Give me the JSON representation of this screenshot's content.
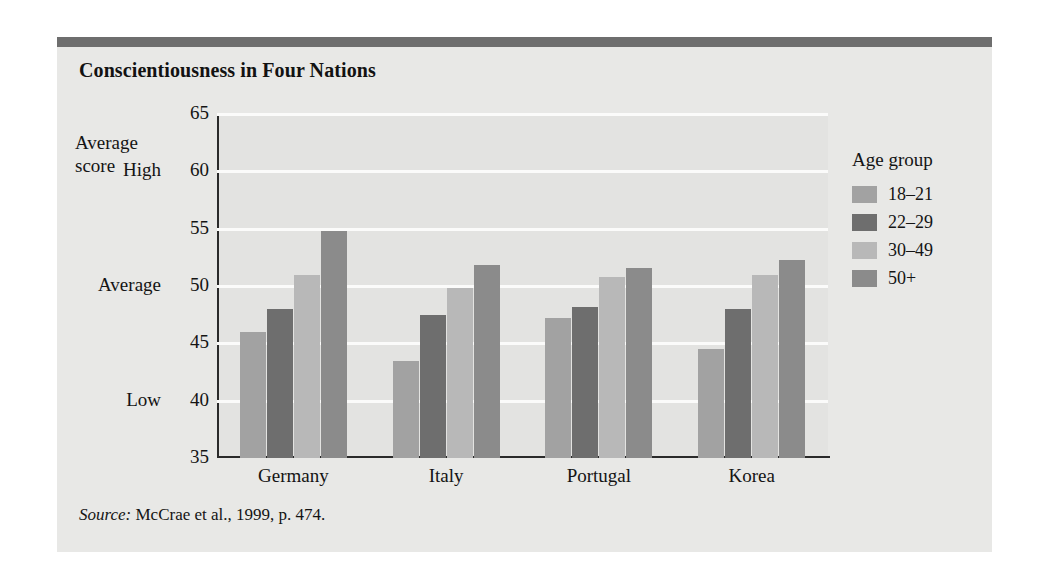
{
  "figure": {
    "title": "Conscientiousness in Four Nations",
    "source_label": "Source:",
    "source_text": "McCrae et al., 1999, p. 474."
  },
  "legend": {
    "title": "Age group"
  },
  "axis": {
    "y_caption_line1": "Average",
    "y_caption_line2": "score"
  },
  "chart_data": {
    "type": "bar",
    "title": "Conscientiousness in Four Nations",
    "xlabel": "",
    "ylabel": "Average score",
    "ylim": [
      35,
      65
    ],
    "yticks": [
      35,
      40,
      45,
      50,
      55,
      60,
      65
    ],
    "ytick_labels": [
      "35",
      "40",
      "45",
      "50",
      "55",
      "60",
      "65"
    ],
    "y_anchor_labels": [
      {
        "value": 65,
        "text": "Average score"
      },
      {
        "value": 60,
        "text": "High"
      },
      {
        "value": 50,
        "text": "Average"
      },
      {
        "value": 40,
        "text": "Low"
      }
    ],
    "grid": true,
    "grid_axis": "y",
    "legend_position": "right",
    "legend_title": "Age group",
    "categories": [
      "Germany",
      "Italy",
      "Portugal",
      "Korea"
    ],
    "series": [
      {
        "name": "18–21",
        "color": "#a2a2a2",
        "values": [
          46.0,
          43.5,
          47.2,
          44.5
        ]
      },
      {
        "name": "22–29",
        "color": "#6e6e6e",
        "values": [
          48.0,
          47.5,
          48.2,
          48.0
        ]
      },
      {
        "name": "30–49",
        "color": "#b8b8b8",
        "values": [
          51.0,
          49.8,
          50.8,
          51.0
        ]
      },
      {
        "name": "50+",
        "color": "#8b8b8b",
        "values": [
          54.8,
          51.8,
          51.6,
          52.3
        ]
      }
    ],
    "source": "Source: McCrae et al., 1999, p. 474."
  }
}
